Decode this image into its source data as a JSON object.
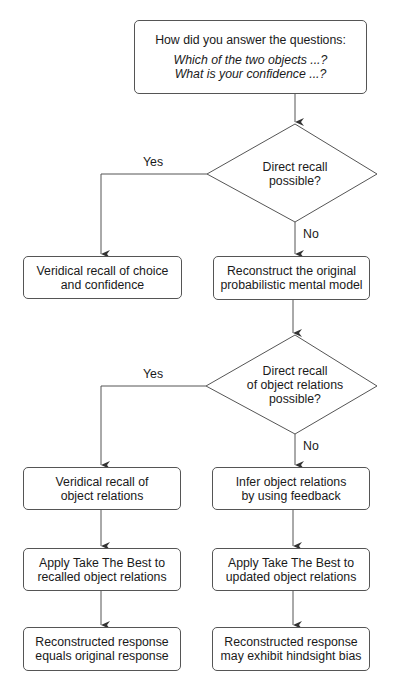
{
  "diagram": {
    "colors": {
      "stroke": "#555555",
      "text": "#1a1a1a",
      "background": "#ffffff"
    },
    "start": {
      "question": "How did you answer the questions:",
      "q1": "Which of the two objects ...?",
      "q2": "What is your confidence ...?"
    },
    "decision1": {
      "line1": "Direct recall",
      "line2": "possible?",
      "yes_label": "Yes",
      "no_label": "No"
    },
    "veridical_choice": {
      "line1": "Veridical recall of choice",
      "line2": "and confidence"
    },
    "reconstruct_model": {
      "line1": "Reconstruct the original",
      "line2": "probabilistic mental model"
    },
    "decision2": {
      "line1": "Direct recall",
      "line2": "of object relations",
      "line3": "possible?",
      "yes_label": "Yes",
      "no_label": "No"
    },
    "veridical_relations": {
      "line1": "Veridical recall of",
      "line2": "object relations"
    },
    "infer_relations": {
      "line1": "Infer object relations",
      "line2": "by using feedback"
    },
    "apply_recalled": {
      "line1": "Apply Take The Best to",
      "line2": "recalled object relations"
    },
    "apply_updated": {
      "line1": "Apply Take The Best to",
      "line2": "updated object relations"
    },
    "result_equal": {
      "line1": "Reconstructed response",
      "line2": "equals original response"
    },
    "result_bias": {
      "line1": "Reconstructed response",
      "line2": "may exhibit hindsight bias"
    }
  }
}
